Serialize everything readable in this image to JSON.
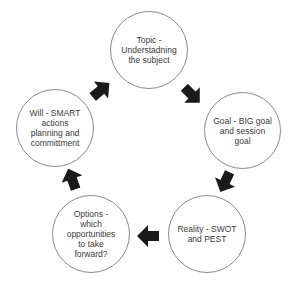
{
  "diagram": {
    "type": "cycle",
    "colors": {
      "circle_border": "#8a8a8a",
      "text": "#3a3a3a",
      "arrow": "#1a1a1a",
      "background": "#ffffff"
    },
    "nodes": [
      {
        "id": "topic",
        "label": "Topic -\nUnderstadning\nthe subject"
      },
      {
        "id": "goal",
        "label": "Goal - BIG goal\nand session\ngoal"
      },
      {
        "id": "reality",
        "label": "Reality - SWOT\nand PEST"
      },
      {
        "id": "options",
        "label": "Options -\nwhich\nopportunities\nto take\nforward?"
      },
      {
        "id": "will",
        "label": "Will - SMART\nactions\nplanning and\ncommittment"
      }
    ],
    "edges": [
      {
        "from": "topic",
        "to": "goal"
      },
      {
        "from": "goal",
        "to": "reality"
      },
      {
        "from": "reality",
        "to": "options"
      },
      {
        "from": "options",
        "to": "will"
      },
      {
        "from": "will",
        "to": "topic"
      }
    ]
  }
}
